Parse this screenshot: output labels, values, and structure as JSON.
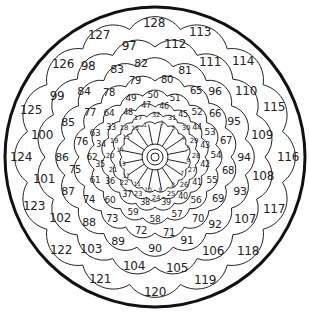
{
  "puzzle": {
    "type": "circular-number-path",
    "center": {
      "x": 155,
      "y": 157
    },
    "outer_radius": 150,
    "colors": {
      "line": "#222222",
      "border": "#111111",
      "background": "#ffffff",
      "text": "#222222"
    },
    "cells": [
      {
        "n": "1",
        "x": 145,
        "y": 125,
        "s": 6
      },
      {
        "n": "2",
        "x": 162,
        "y": 123,
        "s": 6
      },
      {
        "n": "3",
        "x": 173,
        "y": 128,
        "s": 6
      },
      {
        "n": "4",
        "x": 183,
        "y": 138,
        "s": 6
      },
      {
        "n": "5",
        "x": 188,
        "y": 148,
        "s": 6
      },
      {
        "n": "6",
        "x": 188,
        "y": 160,
        "s": 6
      },
      {
        "n": "7",
        "x": 182,
        "y": 173,
        "s": 6
      },
      {
        "n": "8",
        "x": 173,
        "y": 185,
        "s": 6
      },
      {
        "n": "9",
        "x": 160,
        "y": 190,
        "s": 6
      },
      {
        "n": "10",
        "x": 148,
        "y": 190,
        "s": 6
      },
      {
        "n": "11",
        "x": 137,
        "y": 184,
        "s": 6
      },
      {
        "n": "12",
        "x": 126,
        "y": 176,
        "s": 6
      },
      {
        "n": "13",
        "x": 122,
        "y": 164,
        "s": 6
      },
      {
        "n": "14",
        "x": 120,
        "y": 150,
        "s": 6
      },
      {
        "n": "15",
        "x": 126,
        "y": 137,
        "s": 6
      },
      {
        "n": "16",
        "x": 135,
        "y": 128,
        "s": 6
      },
      {
        "n": "17",
        "x": 138,
        "y": 118,
        "s": 7
      },
      {
        "n": "18",
        "x": 124,
        "y": 128,
        "s": 7
      },
      {
        "n": "19",
        "x": 114,
        "y": 141,
        "s": 7
      },
      {
        "n": "20",
        "x": 110,
        "y": 156,
        "s": 7
      },
      {
        "n": "21",
        "x": 113,
        "y": 170,
        "s": 7
      },
      {
        "n": "22",
        "x": 124,
        "y": 183,
        "s": 7
      },
      {
        "n": "23",
        "x": 138,
        "y": 194,
        "s": 7
      },
      {
        "n": "24",
        "x": 156,
        "y": 198,
        "s": 7
      },
      {
        "n": "25",
        "x": 171,
        "y": 194,
        "s": 7
      },
      {
        "n": "26",
        "x": 184,
        "y": 185,
        "s": 7
      },
      {
        "n": "27",
        "x": 192,
        "y": 170,
        "s": 7
      },
      {
        "n": "28",
        "x": 196,
        "y": 156,
        "s": 7
      },
      {
        "n": "29",
        "x": 194,
        "y": 141,
        "s": 7
      },
      {
        "n": "30",
        "x": 186,
        "y": 128,
        "s": 7
      },
      {
        "n": "31",
        "x": 172,
        "y": 118,
        "s": 7
      },
      {
        "n": "32",
        "x": 156,
        "y": 115,
        "s": 7
      },
      {
        "n": "33",
        "x": 111,
        "y": 128,
        "s": 8
      },
      {
        "n": "34",
        "x": 101,
        "y": 145,
        "s": 8
      },
      {
        "n": "35",
        "x": 100,
        "y": 165,
        "s": 8
      },
      {
        "n": "36",
        "x": 110,
        "y": 182,
        "s": 8
      },
      {
        "n": "37",
        "x": 127,
        "y": 195,
        "s": 8
      },
      {
        "n": "38",
        "x": 145,
        "y": 203,
        "s": 8
      },
      {
        "n": "39",
        "x": 166,
        "y": 203,
        "s": 8
      },
      {
        "n": "40",
        "x": 183,
        "y": 197,
        "s": 8
      },
      {
        "n": "41",
        "x": 197,
        "y": 183,
        "s": 8
      },
      {
        "n": "42",
        "x": 205,
        "y": 165,
        "s": 8
      },
      {
        "n": "43",
        "x": 205,
        "y": 146,
        "s": 8
      },
      {
        "n": "44",
        "x": 197,
        "y": 128,
        "s": 8
      },
      {
        "n": "45",
        "x": 183,
        "y": 115,
        "s": 8
      },
      {
        "n": "46",
        "x": 164,
        "y": 107,
        "s": 8
      },
      {
        "n": "47",
        "x": 146,
        "y": 106,
        "s": 8
      },
      {
        "n": "48",
        "x": 128,
        "y": 113,
        "s": 8
      },
      {
        "n": "49",
        "x": 131,
        "y": 98,
        "s": 9
      },
      {
        "n": "50",
        "x": 153,
        "y": 95,
        "s": 9
      },
      {
        "n": "51",
        "x": 175,
        "y": 98,
        "s": 9
      },
      {
        "n": "52",
        "x": 197,
        "y": 112,
        "s": 9
      },
      {
        "n": "53",
        "x": 210,
        "y": 132,
        "s": 9
      },
      {
        "n": "54",
        "x": 216,
        "y": 155,
        "s": 9
      },
      {
        "n": "55",
        "x": 212,
        "y": 180,
        "s": 9
      },
      {
        "n": "56",
        "x": 196,
        "y": 200,
        "s": 9
      },
      {
        "n": "57",
        "x": 177,
        "y": 214,
        "s": 9
      },
      {
        "n": "58",
        "x": 155,
        "y": 219,
        "s": 9
      },
      {
        "n": "59",
        "x": 133,
        "y": 212,
        "s": 9
      },
      {
        "n": "60",
        "x": 110,
        "y": 200,
        "s": 9
      },
      {
        "n": "61",
        "x": 95,
        "y": 180,
        "s": 9
      },
      {
        "n": "62",
        "x": 92,
        "y": 157,
        "s": 9
      },
      {
        "n": "63",
        "x": 95,
        "y": 133,
        "s": 9
      },
      {
        "n": "64",
        "x": 109,
        "y": 113,
        "s": 9
      },
      {
        "n": "65",
        "x": 196,
        "y": 91,
        "s": 10
      },
      {
        "n": "66",
        "x": 215,
        "y": 114,
        "s": 10
      },
      {
        "n": "67",
        "x": 226,
        "y": 141,
        "s": 10
      },
      {
        "n": "68",
        "x": 228,
        "y": 171,
        "s": 10
      },
      {
        "n": "69",
        "x": 218,
        "y": 199,
        "s": 10
      },
      {
        "n": "70",
        "x": 198,
        "y": 219,
        "s": 10
      },
      {
        "n": "71",
        "x": 169,
        "y": 233,
        "s": 10
      },
      {
        "n": "72",
        "x": 141,
        "y": 231,
        "s": 10
      },
      {
        "n": "73",
        "x": 112,
        "y": 219,
        "s": 10
      },
      {
        "n": "74",
        "x": 89,
        "y": 200,
        "s": 10
      },
      {
        "n": "75",
        "x": 75,
        "y": 170,
        "s": 10
      },
      {
        "n": "76",
        "x": 82,
        "y": 142,
        "s": 10
      },
      {
        "n": "77",
        "x": 90,
        "y": 113,
        "s": 10
      },
      {
        "n": "78",
        "x": 109,
        "y": 93,
        "s": 10
      },
      {
        "n": "79",
        "x": 135,
        "y": 81,
        "s": 10
      },
      {
        "n": "80",
        "x": 167,
        "y": 80,
        "s": 10
      },
      {
        "n": "81",
        "x": 185,
        "y": 70,
        "s": 11
      },
      {
        "n": "82",
        "x": 141,
        "y": 63,
        "s": 11
      },
      {
        "n": "83",
        "x": 117,
        "y": 69,
        "s": 11
      },
      {
        "n": "84",
        "x": 84,
        "y": 91,
        "s": 11
      },
      {
        "n": "85",
        "x": 68,
        "y": 122,
        "s": 11
      },
      {
        "n": "86",
        "x": 62,
        "y": 157,
        "s": 11
      },
      {
        "n": "87",
        "x": 68,
        "y": 191,
        "s": 11
      },
      {
        "n": "88",
        "x": 89,
        "y": 222,
        "s": 11
      },
      {
        "n": "89",
        "x": 118,
        "y": 241,
        "s": 11
      },
      {
        "n": "90",
        "x": 155,
        "y": 248,
        "s": 11
      },
      {
        "n": "91",
        "x": 187,
        "y": 240,
        "s": 11
      },
      {
        "n": "92",
        "x": 215,
        "y": 224,
        "s": 11
      },
      {
        "n": "93",
        "x": 240,
        "y": 191,
        "s": 11
      },
      {
        "n": "94",
        "x": 244,
        "y": 157,
        "s": 11
      },
      {
        "n": "95",
        "x": 234,
        "y": 121,
        "s": 11
      },
      {
        "n": "96",
        "x": 215,
        "y": 91,
        "s": 11
      },
      {
        "n": "97",
        "x": 129,
        "y": 46,
        "s": 12
      },
      {
        "n": "98",
        "x": 88,
        "y": 66,
        "s": 12
      },
      {
        "n": "99",
        "x": 57,
        "y": 96,
        "s": 12
      },
      {
        "n": "100",
        "x": 42,
        "y": 135,
        "s": 12
      },
      {
        "n": "101",
        "x": 44,
        "y": 179,
        "s": 12
      },
      {
        "n": "102",
        "x": 60,
        "y": 218,
        "s": 12
      },
      {
        "n": "103",
        "x": 91,
        "y": 249,
        "s": 12
      },
      {
        "n": "104",
        "x": 134,
        "y": 266,
        "s": 12
      },
      {
        "n": "105",
        "x": 177,
        "y": 268,
        "s": 12
      },
      {
        "n": "106",
        "x": 213,
        "y": 251,
        "s": 12
      },
      {
        "n": "107",
        "x": 245,
        "y": 219,
        "s": 12
      },
      {
        "n": "108",
        "x": 263,
        "y": 176,
        "s": 12
      },
      {
        "n": "109",
        "x": 262,
        "y": 135,
        "s": 12
      },
      {
        "n": "110",
        "x": 246,
        "y": 91,
        "s": 12
      },
      {
        "n": "111",
        "x": 210,
        "y": 62,
        "s": 12
      },
      {
        "n": "112",
        "x": 175,
        "y": 44,
        "s": 12
      },
      {
        "n": "113",
        "x": 200,
        "y": 32,
        "s": 12
      },
      {
        "n": "114",
        "x": 243,
        "y": 61,
        "s": 12
      },
      {
        "n": "115",
        "x": 274,
        "y": 107,
        "s": 12
      },
      {
        "n": "116",
        "x": 288,
        "y": 157,
        "s": 12
      },
      {
        "n": "117",
        "x": 274,
        "y": 209,
        "s": 12
      },
      {
        "n": "118",
        "x": 248,
        "y": 251,
        "s": 12
      },
      {
        "n": "119",
        "x": 205,
        "y": 280,
        "s": 12
      },
      {
        "n": "120",
        "x": 155,
        "y": 292,
        "s": 12
      },
      {
        "n": "121",
        "x": 100,
        "y": 279,
        "s": 12
      },
      {
        "n": "122",
        "x": 61,
        "y": 250,
        "s": 12
      },
      {
        "n": "123",
        "x": 34,
        "y": 206,
        "s": 12
      },
      {
        "n": "124",
        "x": 21,
        "y": 157,
        "s": 12
      },
      {
        "n": "125",
        "x": 31,
        "y": 110,
        "s": 12
      },
      {
        "n": "126",
        "x": 63,
        "y": 64,
        "s": 12
      },
      {
        "n": "127",
        "x": 99,
        "y": 35,
        "s": 12
      },
      {
        "n": "128",
        "x": 154,
        "y": 23,
        "s": 12
      }
    ]
  }
}
